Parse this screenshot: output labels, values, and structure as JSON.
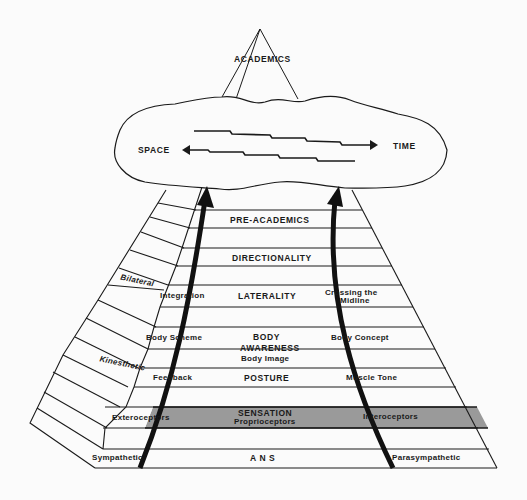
{
  "diagram": {
    "apex": {
      "label": "ACADEMICS"
    },
    "cloud": {
      "left_label": "SPACE",
      "right_label": "TIME"
    },
    "levels": {
      "pre_academics": {
        "center": "PRE-ACADEMICS"
      },
      "directionality": {
        "center": "DIRECTIONALITY"
      },
      "laterality": {
        "left": "Bilateral  Integration",
        "left_a": "Bilateral",
        "left_b": "Integration",
        "center": "LATERALITY",
        "right_1": "Crossing  the",
        "right_2": "Midline"
      },
      "body_awareness": {
        "left": "Body  Scheme",
        "center_1": "BODY",
        "center_2": "AWARENESS",
        "center_3": "Body  Image",
        "right": "Body Concept"
      },
      "posture": {
        "left": "Kinesthetic Feedback",
        "left_a": "Kinesthetic",
        "left_b": "Feedback",
        "center": "POSTURE",
        "right": "Muscle  Tone"
      },
      "sensation": {
        "left": "Exteroceptors",
        "center_1": "SENSATION",
        "center_2": "Proprioceptors",
        "right": "Interoceptors"
      },
      "ans": {
        "left": "Sympathetic",
        "center": "A N S",
        "right": "Parasympathetic"
      }
    },
    "colors": {
      "line": "#1a1a1a",
      "shade": "#9a9a9a",
      "background": "#fbfbfb"
    }
  }
}
